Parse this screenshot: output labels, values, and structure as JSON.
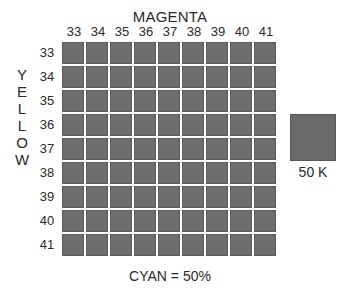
{
  "diagram": {
    "x_axis_title": "MAGENTA",
    "y_axis_title": "YELLOW",
    "y_axis_letters": [
      "Y",
      "E",
      "L",
      "L",
      "O",
      "W"
    ],
    "columns": [
      "33",
      "34",
      "35",
      "36",
      "37",
      "38",
      "39",
      "40",
      "41"
    ],
    "rows": [
      "33",
      "34",
      "35",
      "36",
      "37",
      "38",
      "39",
      "40",
      "41"
    ],
    "cell_color": "#6e6e6e",
    "fixed_channel_label": "CYAN = 50%",
    "reference_swatch": {
      "label": "50 K",
      "color": "#6a6a6a"
    }
  }
}
